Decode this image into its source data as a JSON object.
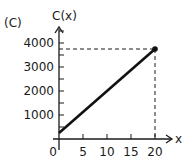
{
  "panel_label": "(C)",
  "chart_data": {
    "type": "line",
    "title": "",
    "panel_label": "(C)",
    "xlabel": "x",
    "ylabel": "C(x)",
    "x": [
      0,
      20
    ],
    "series": [
      {
        "name": "C(x)",
        "values": [
          250,
          3750
        ]
      }
    ],
    "highlight_point": {
      "x": 20,
      "y": 3750,
      "dashed_guides": true
    },
    "x_ticks": [
      0,
      5,
      10,
      15,
      20
    ],
    "x_tick_labels": [
      "0",
      "5",
      "10",
      "15",
      "20"
    ],
    "y_ticks": [
      1000,
      2000,
      3000,
      4000
    ],
    "y_tick_labels": [
      "1000",
      "2000",
      "3000",
      "4000"
    ],
    "y_minor_step": 500,
    "xlim": [
      0,
      22
    ],
    "ylim": [
      0,
      4500
    ],
    "grid": false,
    "legend": "none",
    "colors": {
      "line": "#111111",
      "axis": "#1a1a1a",
      "guide": "#1a1a1a"
    }
  }
}
